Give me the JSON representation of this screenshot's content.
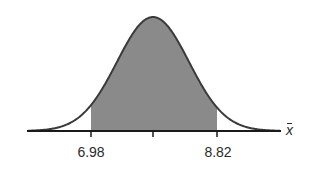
{
  "chart_data": {
    "type": "area",
    "title": "",
    "xlabel": "x̄",
    "ylabel": "",
    "tick_labels": [
      "6.98",
      "",
      "8.82"
    ],
    "shaded_region": {
      "from": 6.98,
      "to": 8.82
    },
    "center": 7.9,
    "grid": false,
    "colors": {
      "shade": "#8a8a8a",
      "curve": "#3a3a3a",
      "axis": "#1a1a1a"
    }
  },
  "labels": {
    "left": "6.98",
    "right": "8.82",
    "axis": "x"
  }
}
